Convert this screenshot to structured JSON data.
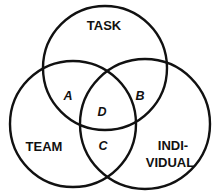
{
  "diagram": {
    "type": "venn",
    "sets": [
      {
        "id": "task",
        "label": "TASK"
      },
      {
        "id": "team",
        "label": "TEAM"
      },
      {
        "id": "individual",
        "label_line1": "INDI-",
        "label_line2": "VIDUAL"
      }
    ],
    "regions": {
      "a": "A",
      "b": "B",
      "c": "C",
      "d": "D"
    },
    "stroke_color": "#111111",
    "background_color": "#ffffff"
  }
}
